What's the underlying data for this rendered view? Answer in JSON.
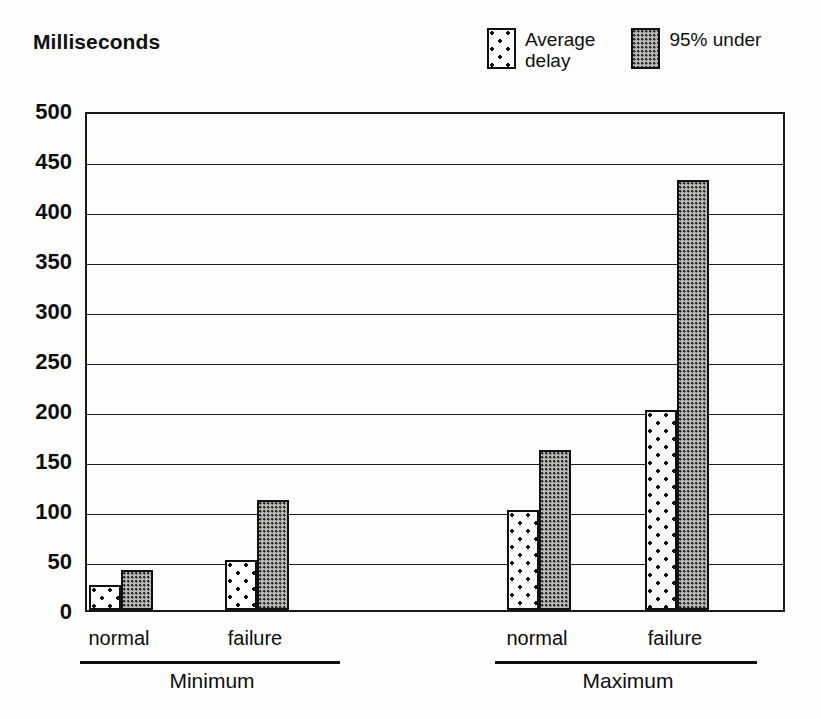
{
  "header": {
    "title": "Milliseconds"
  },
  "legend": {
    "items": [
      {
        "label": "Average\ndelay",
        "swatch": "sparse-dot-swatch-icon",
        "pattern": "sparse",
        "color": "#fdfdfb"
      },
      {
        "label": "95% under",
        "swatch": "dense-dot-swatch-icon",
        "pattern": "dense",
        "color": "#b9b9b5"
      }
    ]
  },
  "chart_data": {
    "type": "bar",
    "title": "Milliseconds",
    "xlabel": "",
    "ylabel": "Milliseconds",
    "ylim": [
      0,
      500
    ],
    "yticks": [
      0,
      50,
      100,
      150,
      200,
      250,
      300,
      350,
      400,
      450,
      500
    ],
    "ytick_labels": [
      "0",
      "50",
      "100",
      "150",
      "200",
      "250",
      "300",
      "350",
      "400",
      "450",
      "500"
    ],
    "grid": true,
    "legend_position": "top-right",
    "categories": [
      "normal",
      "failure",
      "normal",
      "failure"
    ],
    "groups": [
      {
        "label": "Minimum",
        "categories": [
          "normal",
          "failure"
        ]
      },
      {
        "label": "Maximum",
        "categories": [
          "normal",
          "failure"
        ]
      }
    ],
    "series": [
      {
        "name": "Average delay",
        "values": [
          25,
          50,
          100,
          200
        ]
      },
      {
        "name": "95% under",
        "values": [
          40,
          110,
          160,
          430
        ]
      }
    ],
    "bars": [
      {
        "group": "Minimum",
        "category": "normal",
        "series": "Average delay",
        "value": 25,
        "x": 2,
        "width": 32
      },
      {
        "group": "Minimum",
        "category": "normal",
        "series": "95% under",
        "value": 40,
        "x": 34,
        "width": 32
      },
      {
        "group": "Minimum",
        "category": "failure",
        "series": "Average delay",
        "value": 50,
        "x": 138,
        "width": 32
      },
      {
        "group": "Minimum",
        "category": "failure",
        "series": "95% under",
        "value": 110,
        "x": 170,
        "width": 32
      },
      {
        "group": "Maximum",
        "category": "normal",
        "series": "Average delay",
        "value": 100,
        "x": 420,
        "width": 32
      },
      {
        "group": "Maximum",
        "category": "normal",
        "series": "95% under",
        "value": 160,
        "x": 452,
        "width": 32
      },
      {
        "group": "Maximum",
        "category": "failure",
        "series": "Average delay",
        "value": 200,
        "x": 558,
        "width": 32
      },
      {
        "group": "Maximum",
        "category": "failure",
        "series": "95% under",
        "value": 430,
        "x": 590,
        "width": 32
      }
    ]
  },
  "axis": {
    "x_tick_labels": [
      {
        "text": "normal",
        "center": 119
      },
      {
        "text": "failure",
        "center": 255
      },
      {
        "text": "normal",
        "center": 537
      },
      {
        "text": "failure",
        "center": 675
      }
    ],
    "group_rules": [
      {
        "left": 80,
        "width": 260
      },
      {
        "left": 495,
        "width": 262
      }
    ],
    "group_labels": [
      {
        "text": "Minimum",
        "center": 212
      },
      {
        "text": "Maximum",
        "center": 628
      }
    ]
  },
  "colors": {
    "ink": "#111111",
    "paper": "#fdfdfb",
    "dense_fill": "#b9b9b5"
  }
}
